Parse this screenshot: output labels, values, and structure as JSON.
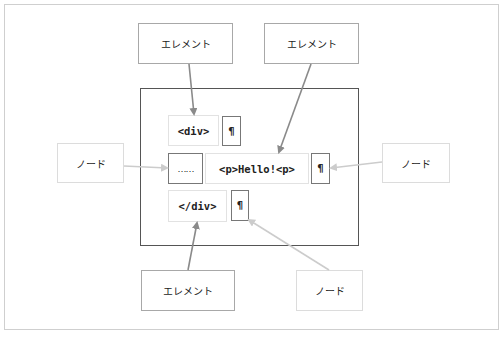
{
  "diagram": {
    "labels": {
      "element_top_left": "エレメント",
      "element_top_right": "エレメント",
      "element_bottom": "エレメント",
      "node_left": "ノード",
      "node_right": "ノード",
      "node_bottom": "ノード"
    },
    "code": {
      "row1": {
        "tag": "<div>",
        "pilcrow": "¶"
      },
      "row2": {
        "text_node": "……",
        "tag": "<p>Hello!<p>",
        "pilcrow": "¶"
      },
      "row3": {
        "tag": "</div>",
        "pilcrow": "¶"
      }
    },
    "colors": {
      "element_arrow": "#8a8a8a",
      "node_arrow": "#cccccc",
      "frame_border": "#555555"
    }
  }
}
